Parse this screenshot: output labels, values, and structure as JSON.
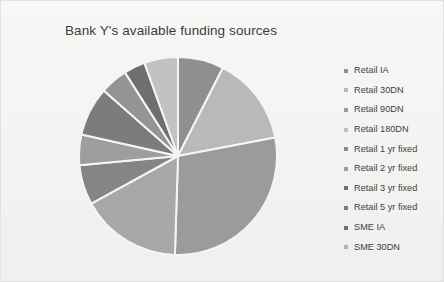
{
  "chart_data": {
    "type": "pie",
    "title": "Bank Y's available funding sources",
    "xlabel": "",
    "ylabel": "",
    "legend_position": "right",
    "grid": false,
    "categories": [
      "Retail IA",
      "Retail 30DN",
      "Retail 90DN",
      "Retail 180DN",
      "Retail 1 yr fixed",
      "Retail 2 yr fixed",
      "Retail 3 yr fixed",
      "Retail 5 yr fixed",
      "SME IA",
      "SME 30DN"
    ],
    "values": [
      7.5,
      14.5,
      28.5,
      16.5,
      6.5,
      5.0,
      8.0,
      4.5,
      3.5,
      5.5
    ],
    "colors": [
      "#8f8f8f",
      "#b9b9b9",
      "#9b9b9b",
      "#a8a8a8",
      "#858585",
      "#9e9e9e",
      "#7c7c7c",
      "#949494",
      "#6f6f6f",
      "#c2c2c2"
    ],
    "start_angle_deg": 0,
    "direction": "clockwise",
    "slice_gap_color": "#f5f5f3"
  },
  "legend": {
    "items": [
      {
        "label": "Retail IA",
        "color": "#8f8f8f"
      },
      {
        "label": "Retail 30DN",
        "color": "#b9b9b9"
      },
      {
        "label": "Retail 90DN",
        "color": "#9b9b9b"
      },
      {
        "label": "Retail 180DN",
        "color": "#c0c0c0"
      },
      {
        "label": "Retail 1 yr fixed",
        "color": "#8b8b8b"
      },
      {
        "label": "Retail 2 yr fixed",
        "color": "#9e9e9e"
      },
      {
        "label": "Retail 3 yr fixed",
        "color": "#6f6f6f"
      },
      {
        "label": "Retail 5 yr fixed",
        "color": "#787878"
      },
      {
        "label": "SME IA",
        "color": "#707070"
      },
      {
        "label": "SME 30DN",
        "color": "#b0b0b0"
      }
    ]
  },
  "canvas": {
    "background": "#f2f2f0",
    "title_color": "#3c3c3c"
  }
}
